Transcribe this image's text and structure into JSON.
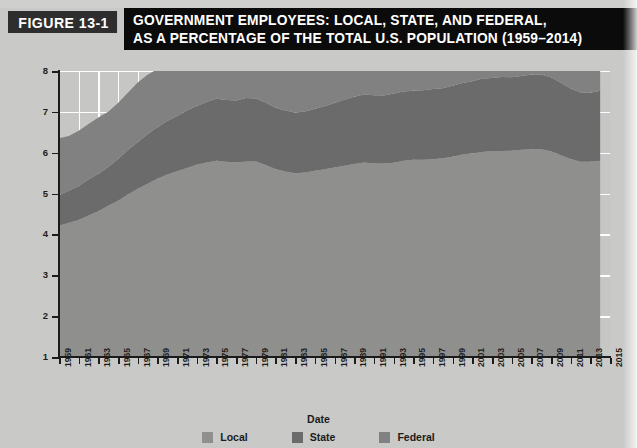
{
  "figure": {
    "tag": "FIGURE 13-1",
    "title_line1": "GOVERNMENT EMPLOYEES: LOCAL, STATE, AND FEDERAL,",
    "title_line2": "AS A PERCENTAGE OF THE TOTAL U.S. POPULATION (1959–2014)"
  },
  "colors": {
    "page_background": "#c9c9c7",
    "plot_background": "#c6c6c4",
    "gridline": "#ffffff",
    "axis": "#1b1b1b",
    "banner_black": "#0b0b0b",
    "banner_tag": "#2e2e2e",
    "local": "#8f8f8d",
    "state": "#6b6b6b",
    "federal": "#818181"
  },
  "legend": {
    "position": "bottom-center",
    "items": [
      {
        "label": "Local",
        "color": "#8f8f8d"
      },
      {
        "label": "State",
        "color": "#6b6b6b"
      },
      {
        "label": "Federal",
        "color": "#818181"
      }
    ]
  },
  "chart_data": {
    "type": "area",
    "stacked": true,
    "title": "GOVERNMENT EMPLOYEES: LOCAL, STATE, AND FEDERAL, AS A PERCENTAGE OF THE TOTAL U.S. POPULATION (1959–2014)",
    "xlabel": "Date",
    "ylabel": "Percentage of Population",
    "xlim": [
      1959,
      2015
    ],
    "ylim": [
      1,
      8
    ],
    "ytick_values": [
      1,
      2,
      3,
      4,
      5,
      6,
      7,
      8
    ],
    "xtick_values": [
      1959,
      1961,
      1963,
      1965,
      1967,
      1969,
      1971,
      1973,
      1975,
      1977,
      1979,
      1981,
      1983,
      1985,
      1987,
      1989,
      1991,
      1993,
      1995,
      1997,
      1999,
      2001,
      2003,
      2005,
      2007,
      2009,
      2011,
      2013,
      2015
    ],
    "xtick_labels": [
      "1959",
      "1961",
      "1963",
      "1965",
      "1967",
      "1969",
      "1971",
      "1973",
      "1975",
      "1977",
      "1979",
      "1981",
      "1983",
      "1985",
      "1987",
      "1989",
      "1991",
      "1993",
      "1995",
      "1997",
      "1999",
      "2001",
      "2003",
      "2005",
      "2007",
      "2009",
      "2011",
      "2013",
      "2015"
    ],
    "grid": true,
    "grid_axis": "both",
    "x": [
      1959,
      1960,
      1961,
      1962,
      1963,
      1964,
      1965,
      1966,
      1967,
      1968,
      1969,
      1970,
      1971,
      1972,
      1973,
      1974,
      1975,
      1976,
      1977,
      1978,
      1979,
      1980,
      1981,
      1982,
      1983,
      1984,
      1985,
      1986,
      1987,
      1988,
      1989,
      1990,
      1991,
      1992,
      1993,
      1994,
      1995,
      1996,
      1997,
      1998,
      1999,
      2000,
      2001,
      2002,
      2003,
      2004,
      2005,
      2006,
      2007,
      2008,
      2009,
      2010,
      2011,
      2012,
      2013,
      2014
    ],
    "series": [
      {
        "name": "Local",
        "color": "#8f8f8d",
        "values": [
          3.22,
          3.28,
          3.36,
          3.46,
          3.57,
          3.7,
          3.82,
          3.98,
          4.12,
          4.24,
          4.36,
          4.46,
          4.55,
          4.62,
          4.7,
          4.76,
          4.8,
          4.78,
          4.76,
          4.79,
          4.78,
          4.7,
          4.6,
          4.54,
          4.5,
          4.52,
          4.56,
          4.6,
          4.64,
          4.68,
          4.72,
          4.76,
          4.74,
          4.74,
          4.76,
          4.8,
          4.82,
          4.82,
          4.84,
          4.86,
          4.9,
          4.95,
          4.98,
          5.02,
          5.04,
          5.04,
          5.05,
          5.07,
          5.09,
          5.09,
          5.04,
          4.94,
          4.84,
          4.78,
          4.78,
          4.8
        ]
      },
      {
        "name": "State",
        "color": "#6b6b6b",
        "values": [
          0.76,
          0.79,
          0.83,
          0.87,
          0.91,
          0.96,
          1.01,
          1.08,
          1.14,
          1.2,
          1.26,
          1.31,
          1.36,
          1.4,
          1.44,
          1.48,
          1.52,
          1.52,
          1.52,
          1.55,
          1.56,
          1.54,
          1.5,
          1.48,
          1.48,
          1.5,
          1.52,
          1.55,
          1.58,
          1.6,
          1.63,
          1.66,
          1.66,
          1.66,
          1.68,
          1.7,
          1.7,
          1.7,
          1.71,
          1.72,
          1.74,
          1.76,
          1.78,
          1.8,
          1.8,
          1.8,
          1.8,
          1.81,
          1.82,
          1.83,
          1.82,
          1.78,
          1.74,
          1.7,
          1.7,
          1.7
        ]
      },
      {
        "name": "Federal",
        "color": "#818181",
        "values": [
          1.38,
          1.34,
          1.34,
          1.36,
          1.37,
          1.36,
          1.36,
          1.4,
          1.46,
          1.46,
          1.43,
          1.4,
          1.37,
          1.34,
          1.31,
          1.31,
          1.28,
          1.26,
          1.26,
          1.28,
          1.24,
          1.27,
          1.2,
          1.18,
          1.17,
          1.17,
          1.17,
          1.17,
          1.16,
          1.16,
          1.16,
          1.2,
          1.14,
          1.12,
          1.1,
          1.08,
          1.04,
          1.01,
          0.99,
          0.97,
          0.97,
          1.03,
          0.95,
          0.95,
          0.95,
          0.94,
          0.92,
          0.91,
          0.9,
          0.9,
          0.92,
          0.97,
          0.9,
          0.88,
          0.87,
          0.87
        ]
      }
    ]
  }
}
